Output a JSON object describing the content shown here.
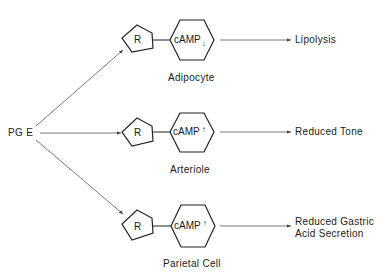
{
  "source": {
    "label": "PG E"
  },
  "receptor_label": "R",
  "messenger_label": "cAMP",
  "pathways": [
    {
      "cell": "Adipocyte",
      "camp_direction": "down",
      "camp_arrow": "↓",
      "effect_lines": [
        "Lipolysis"
      ]
    },
    {
      "cell": "Arteriole",
      "camp_direction": "up",
      "camp_arrow": "↑",
      "effect_lines": [
        "Reduced Tone"
      ]
    },
    {
      "cell": "Parietal Cell",
      "camp_direction": "up",
      "camp_arrow": "↑",
      "effect_lines": [
        "Reduced Gastric",
        "Acid Secretion"
      ]
    }
  ],
  "colors": {
    "line": "#3a3a3a",
    "text": "#1a1a1a",
    "background": "#ffffff"
  }
}
